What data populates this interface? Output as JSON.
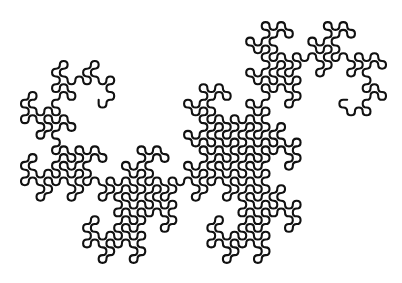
{
  "figure": {
    "title": "",
    "kind": "heighway-dragon-curve",
    "style": "rounded-corners",
    "iterations": 10,
    "background": "#ffffff",
    "stroke_color": "#111111",
    "stroke_width": 2.1,
    "bounds": {
      "left": 21,
      "top": 15,
      "right": 386,
      "bottom": 270
    },
    "endpoints_observed": [
      {
        "x": 341,
        "y": 98
      },
      {
        "x": 101,
        "y": 98
      }
    ]
  }
}
